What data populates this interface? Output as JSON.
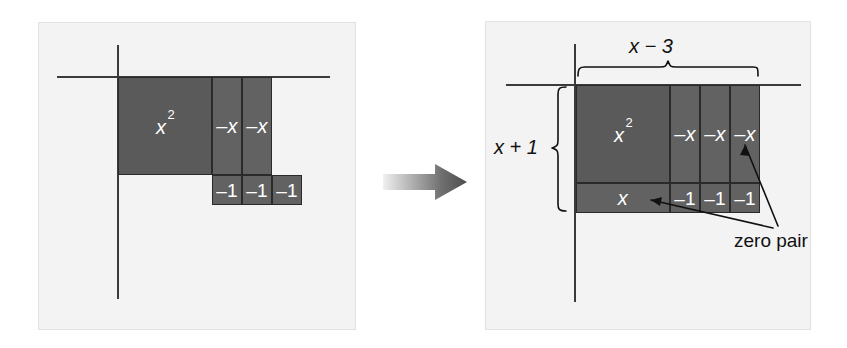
{
  "figure": {
    "type": "algebra-tile-model",
    "transition_icon": "right-arrow-icon"
  },
  "colors": {
    "panel_background": "#f3f3f3",
    "panel_border": "#e2e2e2",
    "tile_dark": "#5a5a5a",
    "tile_medium": "#626262",
    "tile_outline": "#2a2a2a",
    "axis": "#3a3a3a",
    "tile_text": "#ffffff",
    "label_text": "#111111",
    "arrow_gradient_start": "#f0f0f0",
    "arrow_gradient_end": "#4d4d4d"
  },
  "left_panel": {
    "name": "before-grouping",
    "tiles": [
      {
        "id": "x-squared",
        "label": "x",
        "exponent": "2",
        "shade": "dark",
        "x": 118,
        "y": 77,
        "w": 94,
        "h": 98
      },
      {
        "id": "neg-x-1",
        "label": "–x",
        "exponent": "",
        "shade": "medium",
        "x": 212,
        "y": 77,
        "w": 30,
        "h": 98
      },
      {
        "id": "neg-x-2",
        "label": "–x",
        "exponent": "",
        "shade": "medium",
        "x": 242,
        "y": 77,
        "w": 30,
        "h": 98
      },
      {
        "id": "neg-1-1",
        "label": "–1",
        "exponent": "",
        "shade": "medium",
        "x": 212,
        "y": 175,
        "w": 30,
        "h": 30
      },
      {
        "id": "neg-1-2",
        "label": "–1",
        "exponent": "",
        "shade": "medium",
        "x": 242,
        "y": 175,
        "w": 30,
        "h": 30
      },
      {
        "id": "neg-1-3",
        "label": "–1",
        "exponent": "",
        "shade": "medium",
        "x": 272,
        "y": 175,
        "w": 30,
        "h": 30
      }
    ],
    "axes": {
      "horizontal": {
        "x": 57,
        "y": 76,
        "length": 273
      },
      "vertical": {
        "x": 117,
        "y": 45,
        "length": 254
      }
    }
  },
  "right_panel": {
    "name": "after-adding-zero-pairs",
    "tiles": [
      {
        "id": "x-squared",
        "label": "x",
        "exponent": "2",
        "shade": "dark",
        "x": 576,
        "y": 85,
        "w": 94,
        "h": 98
      },
      {
        "id": "neg-x-1",
        "label": "–x",
        "exponent": "",
        "shade": "medium",
        "x": 670,
        "y": 85,
        "w": 30,
        "h": 98
      },
      {
        "id": "neg-x-2",
        "label": "–x",
        "exponent": "",
        "shade": "medium",
        "x": 700,
        "y": 85,
        "w": 30,
        "h": 98
      },
      {
        "id": "neg-x-3",
        "label": "–x",
        "exponent": "",
        "shade": "medium",
        "x": 730,
        "y": 85,
        "w": 30,
        "h": 98
      },
      {
        "id": "x-tile",
        "label": "x",
        "exponent": "",
        "shade": "medium",
        "x": 576,
        "y": 183,
        "w": 94,
        "h": 30
      },
      {
        "id": "neg-1-1",
        "label": "–1",
        "exponent": "",
        "shade": "medium",
        "x": 670,
        "y": 183,
        "w": 30,
        "h": 30
      },
      {
        "id": "neg-1-2",
        "label": "–1",
        "exponent": "",
        "shade": "medium",
        "x": 700,
        "y": 183,
        "w": 30,
        "h": 30
      },
      {
        "id": "neg-1-3",
        "label": "–1",
        "exponent": "",
        "shade": "medium",
        "x": 730,
        "y": 183,
        "w": 30,
        "h": 30
      }
    ],
    "axes": {
      "horizontal": {
        "x": 506,
        "y": 84,
        "length": 295
      },
      "vertical": {
        "x": 574,
        "y": 44,
        "length": 258
      }
    },
    "annotations": {
      "width_label": "x − 3",
      "height_label": "x + 1",
      "zero_pair_label": "zero pair"
    }
  }
}
